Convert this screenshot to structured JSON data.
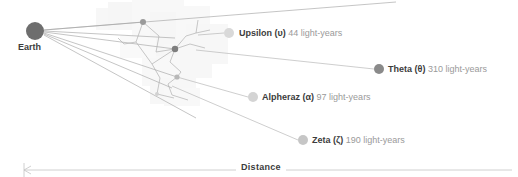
{
  "diagram": {
    "origin": {
      "name": "Earth",
      "label": "Earth",
      "x": 35,
      "y": 31,
      "radius": 9,
      "color": "#6e6e6e"
    },
    "axis": {
      "label": "Distance",
      "direction": "left",
      "y": 170,
      "x_start": 24,
      "x_end": 512,
      "color": "#bfbfbf"
    },
    "stars": [
      {
        "id": "upsilon",
        "name": "Upsilon",
        "greek": "(υ)",
        "distance_value": 44,
        "distance_unit": "light-years",
        "label": "Upsilon (υ) 44 light-years",
        "node_x": 229,
        "node_y": 33,
        "node_radius": 5,
        "node_color": "#d9d9d9",
        "label_x": 239,
        "label_y": 28,
        "leader_from_x": 198,
        "leader_from_y": 35
      },
      {
        "id": "theta",
        "name": "Theta",
        "greek": "(θ)",
        "distance_value": 310,
        "distance_unit": "light-years",
        "label": "Theta (θ) 310 light-years",
        "node_x": 379,
        "node_y": 69,
        "node_radius": 5,
        "node_color": "#8a8a8a",
        "label_x": 388,
        "label_y": 64,
        "leader_from_x": 196,
        "leader_from_y": 50
      },
      {
        "id": "alpheraz",
        "name": "Alpheraz",
        "greek": "(α)",
        "distance_value": 97,
        "distance_unit": "light-years",
        "label": "Alpheraz (α) 97 light-years",
        "node_x": 253,
        "node_y": 97,
        "node_radius": 5,
        "node_color": "#d4d4d4",
        "label_x": 262,
        "label_y": 92,
        "leader_from_x": 177,
        "leader_from_y": 77
      },
      {
        "id": "zeta",
        "name": "Zeta",
        "greek": "(ζ)",
        "distance_value": 190,
        "distance_unit": "light-years",
        "label": "Zeta (ζ) 190 light-years",
        "node_x": 303,
        "node_y": 140,
        "node_radius": 5,
        "node_color": "#c6c6c6",
        "label_x": 312,
        "label_y": 135,
        "leader_from_x": 172,
        "leader_from_y": 86
      }
    ],
    "network_nodes": [
      {
        "id": "n1",
        "x": 143,
        "y": 22,
        "radius": 3.0,
        "color": "#9a9a9a"
      },
      {
        "id": "n2",
        "x": 175,
        "y": 49,
        "radius": 3.2,
        "color": "#7e7e7e"
      },
      {
        "id": "n3",
        "x": 177,
        "y": 77,
        "radius": 2.6,
        "color": "#b8b8b8"
      },
      {
        "id": "n4",
        "x": 157,
        "y": 94,
        "radius": 2.0,
        "color": "#d2d2d2"
      }
    ],
    "colors": {
      "line": "#a8a8a8",
      "line_faint": "#cfcfcf",
      "text_primary": "#3c3c3c",
      "text_secondary": "#9a9a9a",
      "background": "#ffffff",
      "blob": "#f2f2f2"
    }
  }
}
